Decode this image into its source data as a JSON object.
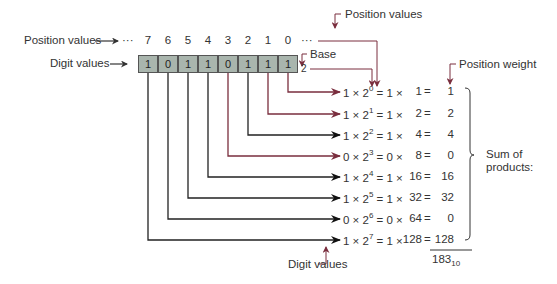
{
  "labels": {
    "position_values_left": "Position values",
    "position_values_top": "Position values",
    "digit_values_left": "Digit values",
    "digit_values_bottom": "Digit values",
    "base": "Base",
    "base_value": "2",
    "position_weight": "Position weight",
    "sum_of_products_1": "Sum of",
    "sum_of_products_2": "products:",
    "ellipsis_left": "···",
    "ellipsis_right": "···"
  },
  "positions": [
    "7",
    "6",
    "5",
    "4",
    "3",
    "2",
    "1",
    "0"
  ],
  "digits": [
    "1",
    "0",
    "1",
    "1",
    "0",
    "1",
    "1",
    "1"
  ],
  "rows": [
    {
      "digit": "1",
      "exp": "0",
      "weight": "1",
      "result": "1",
      "color": "#7a2e3e"
    },
    {
      "digit": "1",
      "exp": "1",
      "weight": "2",
      "result": "2",
      "color": "#7a2e3e"
    },
    {
      "digit": "1",
      "exp": "2",
      "weight": "4",
      "result": "4",
      "color": "#111111"
    },
    {
      "digit": "0",
      "exp": "3",
      "weight": "8",
      "result": "0",
      "color": "#7a2e3e"
    },
    {
      "digit": "1",
      "exp": "4",
      "weight": "16",
      "result": "16",
      "color": "#111111"
    },
    {
      "digit": "1",
      "exp": "5",
      "weight": "32",
      "result": "32",
      "color": "#111111"
    },
    {
      "digit": "0",
      "exp": "6",
      "weight": "64",
      "result": "0",
      "color": "#111111"
    },
    {
      "digit": "1",
      "exp": "7",
      "weight": "128",
      "result": "128",
      "color": "#111111"
    }
  ],
  "total": {
    "value": "183",
    "base": "10"
  },
  "colors": {
    "cell_fill": "#a9b5ad",
    "accent_arrow": "#7a2e3e",
    "dark_arrow": "#111111"
  }
}
